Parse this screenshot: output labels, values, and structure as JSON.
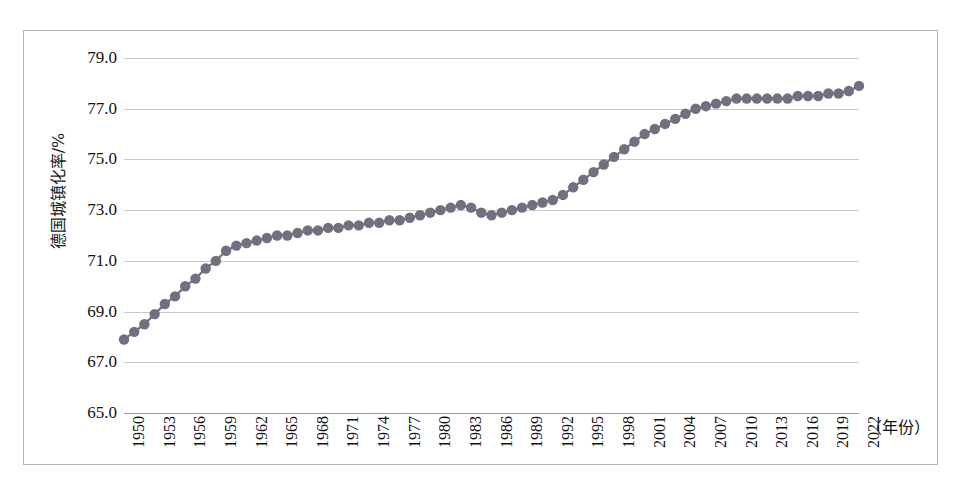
{
  "chart_data": {
    "type": "line",
    "title": "",
    "subtitle": "",
    "xlabel": "（年份）",
    "ylabel": "德国城镇化率/%",
    "legend": [],
    "legend_position": "none",
    "grid": true,
    "marker": "circle",
    "series_color": "#70707f",
    "line_color": "#70707f",
    "xlim": [
      1950,
      2022
    ],
    "ylim": [
      65.0,
      79.0
    ],
    "y_ticks": [
      "79.0",
      "77.0",
      "75.0",
      "73.0",
      "71.0",
      "69.0",
      "67.0",
      "65.0"
    ],
    "y_tick_values": [
      79.0,
      77.0,
      75.0,
      73.0,
      71.0,
      69.0,
      67.0,
      65.0
    ],
    "x_tick_labels": [
      "1950",
      "1953",
      "1956",
      "1959",
      "1962",
      "1965",
      "1968",
      "1971",
      "1974",
      "1977",
      "1980",
      "1983",
      "1986",
      "1989",
      "1992",
      "1995",
      "1998",
      "2001",
      "2004",
      "2007",
      "2010",
      "2013",
      "2016",
      "2019",
      "2022"
    ],
    "x_tick_values": [
      1950,
      1953,
      1956,
      1959,
      1962,
      1965,
      1968,
      1971,
      1974,
      1977,
      1980,
      1983,
      1986,
      1989,
      1992,
      1995,
      1998,
      2001,
      2004,
      2007,
      2010,
      2013,
      2016,
      2019,
      2022
    ],
    "x": [
      1950,
      1951,
      1952,
      1953,
      1954,
      1955,
      1956,
      1957,
      1958,
      1959,
      1960,
      1961,
      1962,
      1963,
      1964,
      1965,
      1966,
      1967,
      1968,
      1969,
      1970,
      1971,
      1972,
      1973,
      1974,
      1975,
      1976,
      1977,
      1978,
      1979,
      1980,
      1981,
      1982,
      1983,
      1984,
      1985,
      1986,
      1987,
      1988,
      1989,
      1990,
      1991,
      1992,
      1993,
      1994,
      1995,
      1996,
      1997,
      1998,
      1999,
      2000,
      2001,
      2002,
      2003,
      2004,
      2005,
      2006,
      2007,
      2008,
      2009,
      2010,
      2011,
      2012,
      2013,
      2014,
      2015,
      2016,
      2017,
      2018,
      2019,
      2020,
      2021,
      2022
    ],
    "values": [
      67.9,
      68.2,
      68.5,
      68.9,
      69.3,
      69.6,
      70.0,
      70.3,
      70.7,
      71.0,
      71.4,
      71.6,
      71.7,
      71.8,
      71.9,
      72.0,
      72.0,
      72.1,
      72.2,
      72.2,
      72.3,
      72.3,
      72.4,
      72.4,
      72.5,
      72.5,
      72.6,
      72.6,
      72.7,
      72.8,
      72.9,
      73.0,
      73.1,
      73.2,
      73.1,
      72.9,
      72.8,
      72.9,
      73.0,
      73.1,
      73.2,
      73.3,
      73.4,
      73.6,
      73.9,
      74.2,
      74.5,
      74.8,
      75.1,
      75.4,
      75.7,
      76.0,
      76.2,
      76.4,
      76.6,
      76.8,
      77.0,
      77.1,
      77.2,
      77.3,
      77.4,
      77.4,
      77.4,
      77.4,
      77.4,
      77.4,
      77.5,
      77.5,
      77.5,
      77.6,
      77.6,
      77.7,
      77.9
    ]
  }
}
